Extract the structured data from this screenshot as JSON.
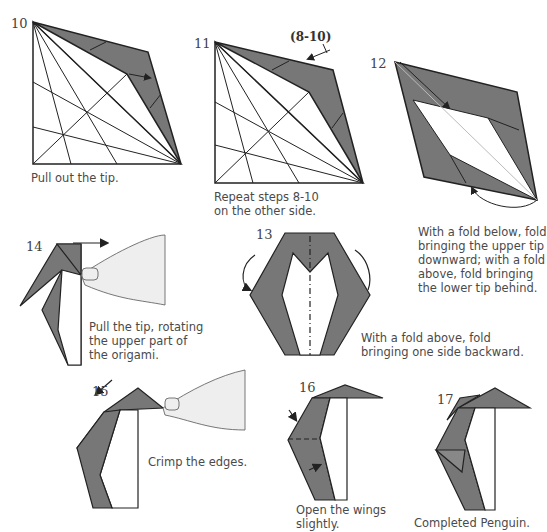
{
  "colors": {
    "paper_dark": "#777777",
    "line": "#222222",
    "hand_fill": "#eeeeee"
  },
  "steps": [
    {
      "number": "10",
      "caption": "Pull out the tip."
    },
    {
      "number": "11",
      "caption_line1": "Repeat steps 8-10",
      "caption_line2": "on the other side.",
      "annotation": "(8-10)"
    },
    {
      "number": "12",
      "caption_lines": [
        "With a fold below, fold",
        "bringing the upper tip",
        "downward; with a fold",
        "above, fold bringing",
        "the lower tip behind."
      ]
    },
    {
      "number": "13",
      "caption_lines": [
        "With a fold above, fold",
        "bringing one side backward."
      ]
    },
    {
      "number": "14",
      "caption_lines": [
        "Pull the tip, rotating",
        "the upper part of",
        "the origami."
      ]
    },
    {
      "number": "15",
      "caption": "Crimp the edges."
    },
    {
      "number": "16",
      "caption_lines": [
        "Open the wings",
        "slightly."
      ]
    },
    {
      "number": "17",
      "caption": "Completed Penguin."
    }
  ]
}
